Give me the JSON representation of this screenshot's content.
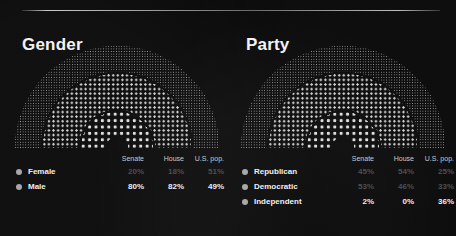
{
  "divider": "horizontal-rule",
  "colors": {
    "background": "#0b0b0c",
    "rule": "#ebebeb",
    "legend_dot": "#a8a8a8",
    "label": "#f0f0f0",
    "value_bright": "#efefef",
    "value_dim": "#4e4e4e"
  },
  "chart_data": [
    {
      "type": "bar",
      "title": "Gender",
      "categories": [
        "Senate",
        "House",
        "U.S. pop."
      ],
      "series": [
        {
          "name": "Female",
          "values": [
            20,
            18,
            51
          ],
          "display": [
            "20%",
            "18%",
            "51%"
          ],
          "emphasis": "dim"
        },
        {
          "name": "Male",
          "values": [
            80,
            82,
            49
          ],
          "display": [
            "80%",
            "82%",
            "49%"
          ],
          "emphasis": "bright"
        }
      ],
      "xlabel": "",
      "ylabel": "",
      "ylim": [
        0,
        100
      ],
      "grid": false,
      "legend_position": "bottom",
      "rings": [
        {
          "name": "U.S. pop.",
          "position": "outer",
          "dot_size": "fine"
        },
        {
          "name": "House",
          "position": "middle",
          "dot_size": "medium"
        },
        {
          "name": "Senate",
          "position": "inner",
          "dot_size": "large"
        }
      ]
    },
    {
      "type": "bar",
      "title": "Party",
      "categories": [
        "Senate",
        "House",
        "U.S. pop."
      ],
      "series": [
        {
          "name": "Republican",
          "values": [
            45,
            54,
            25
          ],
          "display": [
            "45%",
            "54%",
            "25%"
          ],
          "emphasis": "dim"
        },
        {
          "name": "Democratic",
          "values": [
            53,
            46,
            33
          ],
          "display": [
            "53%",
            "46%",
            "33%"
          ],
          "emphasis": "dim"
        },
        {
          "name": "Independent",
          "values": [
            2,
            0,
            36
          ],
          "display": [
            "2%",
            "0%",
            "36%"
          ],
          "emphasis": "bright"
        }
      ],
      "xlabel": "",
      "ylabel": "",
      "ylim": [
        0,
        100
      ],
      "grid": false,
      "legend_position": "bottom",
      "rings": [
        {
          "name": "U.S. pop.",
          "position": "outer",
          "dot_size": "fine"
        },
        {
          "name": "House",
          "position": "middle",
          "dot_size": "medium"
        },
        {
          "name": "Senate",
          "position": "inner",
          "dot_size": "large"
        }
      ]
    }
  ]
}
